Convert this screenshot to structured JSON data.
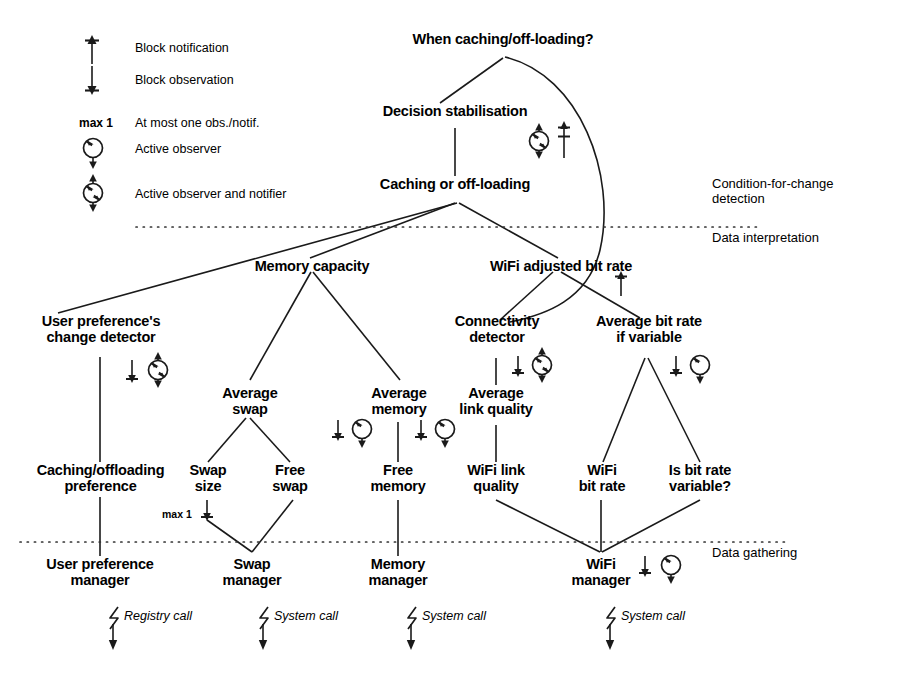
{
  "figure": {
    "title_node": "When caching/off-loading?"
  },
  "legend": {
    "items": [
      {
        "key": "block-notification",
        "icon": "block-notification-icon",
        "label": "Block notification"
      },
      {
        "key": "block-observation",
        "icon": "block-observation-icon",
        "label": "Block observation"
      },
      {
        "key": "max-one",
        "icon": "max-1-text",
        "prefix": "max 1",
        "label": "At most one obs./notif."
      },
      {
        "key": "active-observer",
        "icon": "active-observer-icon",
        "label": "Active observer"
      },
      {
        "key": "active-observer-notifier",
        "icon": "active-observer-and-notifier-icon",
        "label": "Active observer and notifier"
      }
    ]
  },
  "zones": [
    {
      "key": "condition-for-change",
      "label": "Condition-for-change\ndetection"
    },
    {
      "key": "data-interpretation",
      "label": "Data interpretation"
    },
    {
      "key": "data-gathering",
      "label": "Data gathering"
    }
  ],
  "nodes": {
    "when_caching": "When caching/off-loading?",
    "decision_stabilisation": "Decision stabilisation",
    "caching_or_offloading": "Caching or off-loading",
    "memory_capacity": "Memory capacity",
    "wifi_adjusted_bit_rate": "WiFi adjusted bit rate",
    "user_pref_change_detector": "User preference's\nchange detector",
    "connectivity_detector": "Connectivity\ndetector",
    "average_bit_rate_if_variable": "Average bit rate\nif variable",
    "average_swap": "Average\nswap",
    "average_memory": "Average\nmemory",
    "average_link_quality": "Average\nlink quality",
    "caching_offloading_preference": "Caching/offloading\npreference",
    "swap_size": "Swap\nsize",
    "free_swap": "Free\nswap",
    "free_memory": "Free\nmemory",
    "wifi_link_quality": "WiFi link\nquality",
    "wifi_bit_rate": "WiFi\nbit rate",
    "is_bit_rate_variable": "Is bit rate\nvariable?",
    "user_preference_manager": "User preference\nmanager",
    "swap_manager": "Swap\nmanager",
    "memory_manager": "Memory\nmanager",
    "wifi_manager": "WiFi\nmanager"
  },
  "annotations": {
    "max1_swap_size": "max 1",
    "calls": [
      {
        "key": "registry-call",
        "label": "Registry call"
      },
      {
        "key": "system-call-swap",
        "label": "System call"
      },
      {
        "key": "system-call-memory",
        "label": "System call"
      },
      {
        "key": "system-call-wifi",
        "label": "System call"
      }
    ]
  },
  "colors": {
    "ink": "#000000",
    "background": "#ffffff",
    "dotted": "#333333"
  }
}
